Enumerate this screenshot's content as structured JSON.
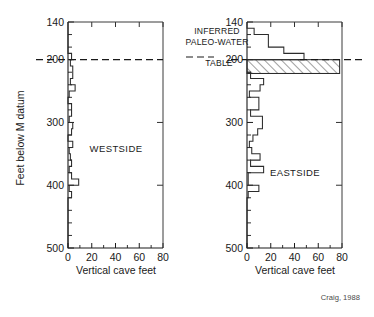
{
  "figure": {
    "credit": "Craig, 1988",
    "annotation": {
      "line1": "INFERRED",
      "line2": "PALEO-WATER",
      "line3": "TABLE"
    }
  },
  "chart_data": [
    {
      "type": "bar",
      "orientation": "horizontal-profile",
      "title": "WESTSIDE",
      "panel": "left",
      "xlabel": "Vertical cave feet",
      "ylabel": "Feet below M datum",
      "xlim": [
        0,
        80
      ],
      "ylim": [
        140,
        500
      ],
      "y_inverted": true,
      "grid": false,
      "xticks": [
        0,
        20,
        40,
        60,
        80
      ],
      "xtick_labels": [
        "0",
        "20",
        "40",
        "60",
        "80"
      ],
      "xminor_step": 10,
      "yticks": [
        140,
        200,
        300,
        400,
        500
      ],
      "ytick_labels": [
        "140",
        "200",
        "300",
        "400",
        "500"
      ],
      "yminor_step": 20,
      "bin_size": 10,
      "bins": [
        {
          "top": 140,
          "bottom": 150,
          "value": 0
        },
        {
          "top": 150,
          "bottom": 160,
          "value": 0
        },
        {
          "top": 160,
          "bottom": 170,
          "value": 0
        },
        {
          "top": 170,
          "bottom": 180,
          "value": 0
        },
        {
          "top": 180,
          "bottom": 190,
          "value": 0
        },
        {
          "top": 190,
          "bottom": 200,
          "value": 3
        },
        {
          "top": 200,
          "bottom": 210,
          "value": 2
        },
        {
          "top": 210,
          "bottom": 220,
          "value": 4
        },
        {
          "top": 220,
          "bottom": 230,
          "value": 4
        },
        {
          "top": 230,
          "bottom": 240,
          "value": 2
        },
        {
          "top": 240,
          "bottom": 250,
          "value": 6
        },
        {
          "top": 250,
          "bottom": 260,
          "value": 1
        },
        {
          "top": 260,
          "bottom": 270,
          "value": 0
        },
        {
          "top": 270,
          "bottom": 280,
          "value": 3
        },
        {
          "top": 280,
          "bottom": 290,
          "value": 3
        },
        {
          "top": 290,
          "bottom": 300,
          "value": 1
        },
        {
          "top": 300,
          "bottom": 310,
          "value": 4
        },
        {
          "top": 310,
          "bottom": 320,
          "value": 3
        },
        {
          "top": 320,
          "bottom": 330,
          "value": 0
        },
        {
          "top": 330,
          "bottom": 340,
          "value": 4
        },
        {
          "top": 340,
          "bottom": 350,
          "value": 1
        },
        {
          "top": 350,
          "bottom": 360,
          "value": 2
        },
        {
          "top": 360,
          "bottom": 370,
          "value": 3
        },
        {
          "top": 370,
          "bottom": 380,
          "value": 1
        },
        {
          "top": 380,
          "bottom": 390,
          "value": 3
        },
        {
          "top": 390,
          "bottom": 400,
          "value": 9
        },
        {
          "top": 400,
          "bottom": 410,
          "value": 1
        },
        {
          "top": 410,
          "bottom": 420,
          "value": 3
        },
        {
          "top": 420,
          "bottom": 430,
          "value": 0
        },
        {
          "top": 430,
          "bottom": 440,
          "value": 0
        },
        {
          "top": 440,
          "bottom": 450,
          "value": 0
        },
        {
          "top": 450,
          "bottom": 460,
          "value": 0
        },
        {
          "top": 460,
          "bottom": 470,
          "value": 0
        },
        {
          "top": 470,
          "bottom": 480,
          "value": 0
        },
        {
          "top": 480,
          "bottom": 490,
          "value": 0
        },
        {
          "top": 490,
          "bottom": 500,
          "value": 0
        }
      ],
      "water_table_line": 200
    },
    {
      "type": "bar",
      "orientation": "horizontal-profile",
      "title": "EASTSIDE",
      "panel": "right",
      "xlabel": "Vertical cave feet",
      "ylabel": "Feet below M datum",
      "xlim": [
        0,
        80
      ],
      "ylim": [
        140,
        500
      ],
      "y_inverted": true,
      "grid": false,
      "xticks": [
        0,
        20,
        40,
        60,
        80
      ],
      "xtick_labels": [
        "0",
        "20",
        "40",
        "60",
        "80"
      ],
      "xminor_step": 10,
      "yticks": [
        140,
        200,
        300,
        400,
        500
      ],
      "ytick_labels": [
        "140",
        "200",
        "300",
        "400",
        "500"
      ],
      "yminor_step": 20,
      "bin_size": 10,
      "bins": [
        {
          "top": 140,
          "bottom": 150,
          "value": 0
        },
        {
          "top": 150,
          "bottom": 160,
          "value": 6
        },
        {
          "top": 160,
          "bottom": 170,
          "value": 18
        },
        {
          "top": 170,
          "bottom": 180,
          "value": 18
        },
        {
          "top": 180,
          "bottom": 190,
          "value": 31
        },
        {
          "top": 190,
          "bottom": 200,
          "value": 48
        },
        {
          "top": 200,
          "bottom": 210,
          "value": 72
        },
        {
          "top": 210,
          "bottom": 220,
          "value": 78
        },
        {
          "top": 220,
          "bottom": 230,
          "value": 3
        },
        {
          "top": 230,
          "bottom": 240,
          "value": 14
        },
        {
          "top": 240,
          "bottom": 250,
          "value": 11
        },
        {
          "top": 250,
          "bottom": 260,
          "value": 2
        },
        {
          "top": 260,
          "bottom": 270,
          "value": 10
        },
        {
          "top": 270,
          "bottom": 280,
          "value": 10
        },
        {
          "top": 280,
          "bottom": 290,
          "value": 3
        },
        {
          "top": 290,
          "bottom": 300,
          "value": 13
        },
        {
          "top": 300,
          "bottom": 310,
          "value": 13
        },
        {
          "top": 310,
          "bottom": 320,
          "value": 9
        },
        {
          "top": 320,
          "bottom": 330,
          "value": 5
        },
        {
          "top": 330,
          "bottom": 340,
          "value": 2
        },
        {
          "top": 340,
          "bottom": 350,
          "value": 4
        },
        {
          "top": 350,
          "bottom": 360,
          "value": 11
        },
        {
          "top": 360,
          "bottom": 370,
          "value": 3
        },
        {
          "top": 370,
          "bottom": 380,
          "value": 14
        },
        {
          "top": 380,
          "bottom": 390,
          "value": 1
        },
        {
          "top": 390,
          "bottom": 400,
          "value": 1
        },
        {
          "top": 400,
          "bottom": 410,
          "value": 10
        },
        {
          "top": 410,
          "bottom": 420,
          "value": 1
        },
        {
          "top": 420,
          "bottom": 430,
          "value": 0
        },
        {
          "top": 430,
          "bottom": 440,
          "value": 0
        },
        {
          "top": 440,
          "bottom": 450,
          "value": 0
        },
        {
          "top": 450,
          "bottom": 460,
          "value": 0
        },
        {
          "top": 460,
          "bottom": 470,
          "value": 0
        },
        {
          "top": 470,
          "bottom": 480,
          "value": 0
        },
        {
          "top": 480,
          "bottom": 490,
          "value": 0
        },
        {
          "top": 490,
          "bottom": 500,
          "value": 0
        }
      ],
      "water_table_line": 200,
      "hatched_band": {
        "top": 200,
        "bottom": 222,
        "extent": 78
      }
    }
  ]
}
